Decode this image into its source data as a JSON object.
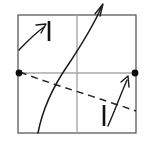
{
  "figure": {
    "width": 144,
    "height": 141,
    "background_color": "#ffffff"
  },
  "colors": {
    "frame": "#595959",
    "axis": "#a8a8a8",
    "dashed_curve": "#262626",
    "solid_curve": "#1a1a1a",
    "tick_mark": "#111111",
    "equilibrium_dot": "#0d0d0d"
  },
  "frame": {
    "name": "square-border",
    "left": 18,
    "top": 15,
    "right": 136,
    "bottom": 133,
    "stroke_width": 1.3
  },
  "axes": {
    "horizontal": {
      "x1": 18,
      "y1": 73,
      "x2": 136,
      "y2": 73
    },
    "vertical": {
      "x1": 77,
      "y1": 15,
      "x2": 77,
      "y2": 133
    }
  },
  "equilibria": [
    {
      "label": "left-equilibrium",
      "cx": 19,
      "cy": 73,
      "r": 3.4
    },
    {
      "label": "right-equilibrium",
      "cx": 135,
      "cy": 73,
      "r": 3.4
    }
  ],
  "dashed_curve": {
    "name": "descending-nullcline",
    "path": "M 20 72 C 45 82, 80 92, 112 103 C 122 106, 130 109, 136 111"
  },
  "solid_curve": {
    "name": "rising-trajectory",
    "path": "M 38 133 C 42 112, 52 88, 68 65 C 82 44, 95 22, 102 6",
    "arrow_head": "M 95 14 L 103 4 L 100 16"
  },
  "flow_arrows": [
    {
      "name": "upper-left-flow-arrow",
      "path": "M 19 50 C 25 44, 33 35, 44 27",
      "head": "M 36 25 L 46 24 L 41 33"
    },
    {
      "name": "lower-right-flow-arrow",
      "path": "M 108 126 C 114 113, 120 96, 127 80",
      "head": "M 121 82 L 128 76 L 129 87"
    }
  ],
  "tick_marks": [
    {
      "name": "upper-tick-mark",
      "x1": 49,
      "y1": 21,
      "x2": 49,
      "y2": 41
    },
    {
      "name": "lower-tick-mark",
      "x1": 104,
      "y1": 105,
      "x2": 104,
      "y2": 126
    }
  ]
}
